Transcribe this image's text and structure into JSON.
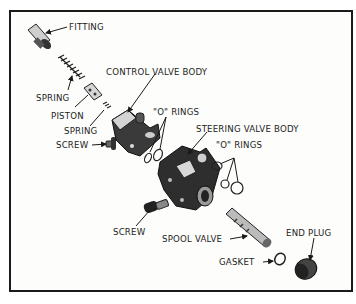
{
  "diagram": {
    "type": "exploded-view",
    "labels": {
      "fitting": "FITTING",
      "spring_1": "SPRING",
      "piston": "PISTON",
      "spring_2": "SPRING",
      "screw_1": "SCREW",
      "control_valve_body": "CONTROL VALVE BODY",
      "o_rings_1": "\"O\" RINGS",
      "steering_valve_body": "STEERING VALVE BODY",
      "o_rings_2": "\"O\" RINGS",
      "screw_2": "SCREW",
      "spool_valve": "SPOOL VALVE",
      "end_plug": "END PLUG",
      "gasket": "GASKET"
    }
  }
}
